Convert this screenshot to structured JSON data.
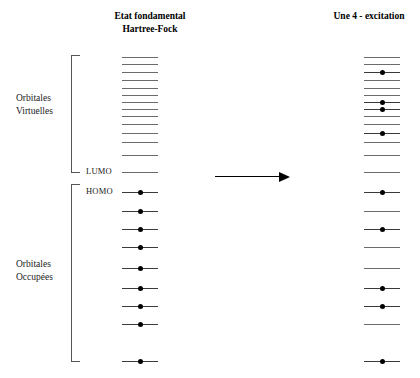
{
  "titles": {
    "left": "Etat fondamental\nHartree-Fock",
    "left_line1": "Etat fondamental",
    "left_line2": "Hartree-Fock",
    "right": "Une 4 - excitation"
  },
  "groups": {
    "virtual_line1": "Orbitales",
    "virtual_line2": "Virtuelles",
    "occupied_line1": "Orbitales",
    "occupied_line2": "Occupées"
  },
  "level_tags": {
    "lumo": "LUMO",
    "homo": "HOMO"
  },
  "colors": {
    "level_line": "#6b6b6b",
    "occupied_line": "#3a3a3a",
    "electron": "#000000",
    "bracket": "#555555",
    "arrow": "#000000",
    "background": "#ffffff",
    "text": "#000000"
  },
  "chart_data": {
    "type": "energy-level-diagram",
    "columns": [
      {
        "name": "left",
        "label": "Etat fondamental Hartree-Fock",
        "x_center": 140,
        "line_width": 36,
        "levels": [
          {
            "index": 0,
            "y": 57,
            "occupied": false,
            "region": "virtual"
          },
          {
            "index": 1,
            "y": 64,
            "occupied": false,
            "region": "virtual"
          },
          {
            "index": 2,
            "y": 72,
            "occupied": false,
            "region": "virtual"
          },
          {
            "index": 3,
            "y": 80,
            "occupied": false,
            "region": "virtual"
          },
          {
            "index": 4,
            "y": 88,
            "occupied": false,
            "region": "virtual"
          },
          {
            "index": 5,
            "y": 95,
            "occupied": false,
            "region": "virtual"
          },
          {
            "index": 6,
            "y": 102,
            "occupied": false,
            "region": "virtual"
          },
          {
            "index": 7,
            "y": 109,
            "occupied": false,
            "region": "virtual"
          },
          {
            "index": 8,
            "y": 116,
            "occupied": false,
            "region": "virtual"
          },
          {
            "index": 9,
            "y": 124,
            "occupied": false,
            "region": "virtual"
          },
          {
            "index": 10,
            "y": 133,
            "occupied": false,
            "region": "virtual"
          },
          {
            "index": 11,
            "y": 142,
            "occupied": false,
            "region": "virtual"
          },
          {
            "index": 12,
            "y": 155,
            "occupied": false,
            "region": "virtual"
          },
          {
            "index": 13,
            "y": 172,
            "occupied": false,
            "region": "virtual",
            "tag": "LUMO"
          },
          {
            "index": 14,
            "y": 192,
            "occupied": true,
            "region": "occupied",
            "tag": "HOMO"
          },
          {
            "index": 15,
            "y": 211,
            "occupied": true,
            "region": "occupied"
          },
          {
            "index": 16,
            "y": 229,
            "occupied": true,
            "region": "occupied"
          },
          {
            "index": 17,
            "y": 247,
            "occupied": true,
            "region": "occupied"
          },
          {
            "index": 18,
            "y": 268,
            "occupied": true,
            "region": "occupied"
          },
          {
            "index": 19,
            "y": 288,
            "occupied": true,
            "region": "occupied"
          },
          {
            "index": 20,
            "y": 306,
            "occupied": true,
            "region": "occupied"
          },
          {
            "index": 21,
            "y": 324,
            "occupied": true,
            "region": "occupied"
          },
          {
            "index": 22,
            "y": 361,
            "occupied": true,
            "region": "occupied"
          }
        ]
      },
      {
        "name": "right",
        "label": "Une 4 - excitation",
        "x_center": 382,
        "line_width": 36,
        "levels": [
          {
            "index": 0,
            "y": 57,
            "occupied": false,
            "region": "virtual"
          },
          {
            "index": 1,
            "y": 64,
            "occupied": false,
            "region": "virtual"
          },
          {
            "index": 2,
            "y": 72,
            "occupied": true,
            "region": "virtual"
          },
          {
            "index": 3,
            "y": 80,
            "occupied": false,
            "region": "virtual"
          },
          {
            "index": 4,
            "y": 88,
            "occupied": false,
            "region": "virtual"
          },
          {
            "index": 5,
            "y": 95,
            "occupied": false,
            "region": "virtual"
          },
          {
            "index": 6,
            "y": 102,
            "occupied": true,
            "region": "virtual"
          },
          {
            "index": 7,
            "y": 109,
            "occupied": true,
            "region": "virtual"
          },
          {
            "index": 8,
            "y": 116,
            "occupied": false,
            "region": "virtual"
          },
          {
            "index": 9,
            "y": 124,
            "occupied": false,
            "region": "virtual"
          },
          {
            "index": 10,
            "y": 133,
            "occupied": true,
            "region": "virtual"
          },
          {
            "index": 11,
            "y": 142,
            "occupied": false,
            "region": "virtual"
          },
          {
            "index": 12,
            "y": 155,
            "occupied": false,
            "region": "virtual"
          },
          {
            "index": 13,
            "y": 172,
            "occupied": false,
            "region": "virtual"
          },
          {
            "index": 14,
            "y": 192,
            "occupied": true,
            "region": "occupied"
          },
          {
            "index": 15,
            "y": 211,
            "occupied": false,
            "region": "occupied"
          },
          {
            "index": 16,
            "y": 229,
            "occupied": true,
            "region": "occupied"
          },
          {
            "index": 17,
            "y": 247,
            "occupied": false,
            "region": "occupied"
          },
          {
            "index": 18,
            "y": 268,
            "occupied": false,
            "region": "occupied"
          },
          {
            "index": 19,
            "y": 288,
            "occupied": true,
            "region": "occupied"
          },
          {
            "index": 20,
            "y": 306,
            "occupied": true,
            "region": "occupied"
          },
          {
            "index": 21,
            "y": 324,
            "occupied": false,
            "region": "occupied"
          },
          {
            "index": 22,
            "y": 361,
            "occupied": true,
            "region": "occupied"
          }
        ]
      }
    ],
    "annotations": {
      "arrow": {
        "from_x": 215,
        "to_x": 290,
        "y": 176,
        "direction": "right"
      }
    },
    "summary": {
      "virtual_count": 14,
      "occupied_count": 9,
      "excitation_order": 4,
      "electrons_promoted": 4
    }
  }
}
